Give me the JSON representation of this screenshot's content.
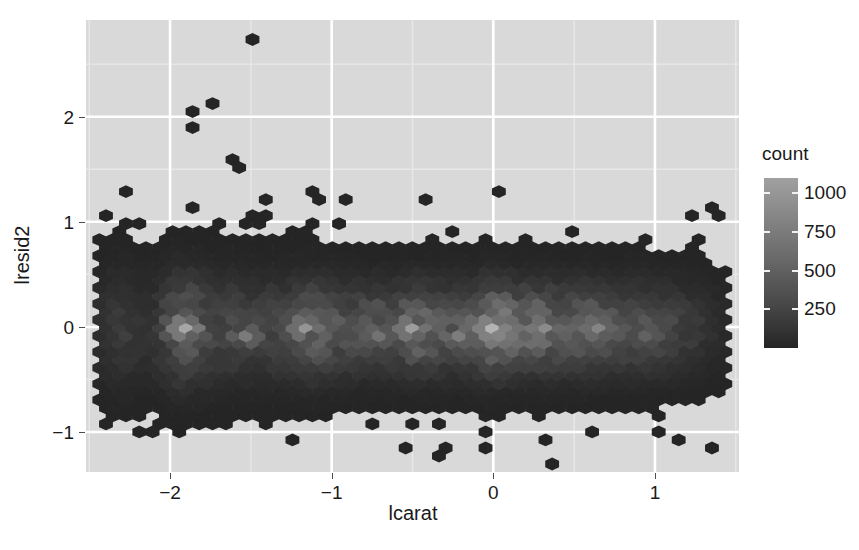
{
  "chart_data": {
    "type": "hexbin",
    "title": "",
    "subtitle": "",
    "xlabel": "lcarat",
    "ylabel": "lresid2",
    "xlim": [
      -2.52,
      1.52
    ],
    "ylim": [
      -1.38,
      2.92
    ],
    "xticks": [
      -2,
      -1,
      0,
      1
    ],
    "xticklabels": [
      "−2",
      "−1",
      "0",
      "1"
    ],
    "yticks": [
      -1,
      0,
      1,
      2
    ],
    "yticklabels": [
      "−1",
      "0",
      "1",
      "2"
    ],
    "grid": true,
    "grid_major_color": "#ffffff",
    "grid_minor_color": "#e8e8e8",
    "panel_background": "#d9d9d9",
    "legend": {
      "position": "right",
      "title": "count",
      "ticks": [
        250,
        500,
        750,
        1000
      ],
      "ticklabels": [
        "250",
        "500",
        "750",
        "1000"
      ],
      "range": [
        0,
        1100
      ],
      "low_color": "#242424",
      "high_color": "#a0a0a0"
    },
    "hex": {
      "bins": 50,
      "x_spacing": 0.0824,
      "y_spacing": 0.0762,
      "fill_low": "#242424",
      "fill_high": "#b5b5b5"
    },
    "max_count": 1100,
    "hotspots": [
      {
        "x": -1.9,
        "y": 0.02,
        "count": 980
      },
      {
        "x": -1.55,
        "y": -0.1,
        "count": 620
      },
      {
        "x": -1.12,
        "y": -0.02,
        "count": 840
      },
      {
        "x": -0.72,
        "y": -0.08,
        "count": 560
      },
      {
        "x": -0.48,
        "y": 0.0,
        "count": 900
      },
      {
        "x": -0.2,
        "y": -0.05,
        "count": 640
      },
      {
        "x": 0.02,
        "y": 0.02,
        "count": 1080
      },
      {
        "x": 0.3,
        "y": -0.04,
        "count": 760
      },
      {
        "x": 0.62,
        "y": -0.02,
        "count": 700
      },
      {
        "x": 0.95,
        "y": -0.06,
        "count": 430
      }
    ],
    "outliers": [
      {
        "x": -1.52,
        "y": 2.74
      },
      {
        "x": -1.9,
        "y": 2.06
      },
      {
        "x": -1.9,
        "y": 1.93
      },
      {
        "x": -1.72,
        "y": 2.12
      },
      {
        "x": -1.58,
        "y": 1.6
      },
      {
        "x": -1.54,
        "y": 1.54
      },
      {
        "x": -1.12,
        "y": 1.26
      },
      {
        "x": -1.08,
        "y": 1.2
      },
      {
        "x": -0.92,
        "y": 1.24
      },
      {
        "x": -0.45,
        "y": 1.24
      },
      {
        "x": 0.03,
        "y": 1.28
      },
      {
        "x": -1.52,
        "y": 1.04
      },
      {
        "x": -1.15,
        "y": 1.02
      },
      {
        "x": -0.98,
        "y": 0.98
      },
      {
        "x": -1.35,
        "y": 0.84
      },
      {
        "x": -1.52,
        "y": 0.8
      },
      {
        "x": -1.1,
        "y": 0.76
      },
      {
        "x": 0.3,
        "y": -1.04
      },
      {
        "x": 0.58,
        "y": -1.02
      },
      {
        "x": 1.32,
        "y": -1.18
      }
    ]
  }
}
